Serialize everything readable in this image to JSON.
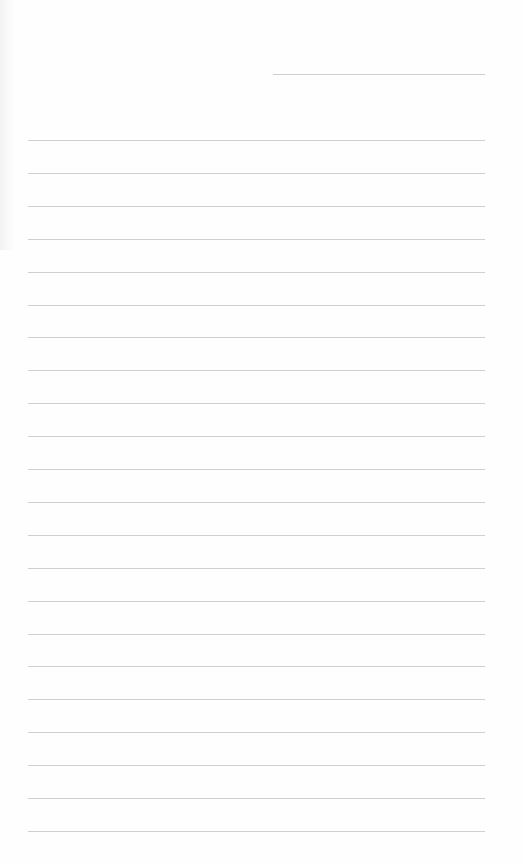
{
  "page": {
    "type": "lined-paper",
    "background": "#fefefe",
    "line_color": "#cfcfcf",
    "header_line": {
      "left": 273,
      "right": 485,
      "top": 74
    },
    "ruled_lines": {
      "left": 28,
      "right": 485,
      "first_top": 140,
      "spacing": 32.9,
      "count": 22
    }
  }
}
